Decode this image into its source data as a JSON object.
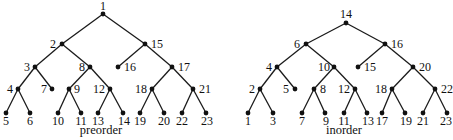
{
  "trees": [
    {
      "caption": "preorder",
      "caption_pos": [
        101,
        134
      ],
      "nodes": [
        {
          "id": "1",
          "x": 103,
          "y": 14,
          "lx": 103,
          "ly": 10,
          "anchor": "middle"
        },
        {
          "id": "2",
          "x": 62,
          "y": 44,
          "lx": 56,
          "ly": 48,
          "anchor": "end"
        },
        {
          "id": "15",
          "x": 145,
          "y": 44,
          "lx": 151,
          "ly": 48,
          "anchor": "start"
        },
        {
          "id": "3",
          "x": 35,
          "y": 67,
          "lx": 30,
          "ly": 71,
          "anchor": "end"
        },
        {
          "id": "8",
          "x": 90,
          "y": 67,
          "lx": 85,
          "ly": 71,
          "anchor": "end"
        },
        {
          "id": "16",
          "x": 118,
          "y": 67,
          "lx": 124,
          "ly": 71,
          "anchor": "start"
        },
        {
          "id": "17",
          "x": 172,
          "y": 67,
          "lx": 178,
          "ly": 71,
          "anchor": "start"
        },
        {
          "id": "4",
          "x": 18,
          "y": 89,
          "lx": 13,
          "ly": 93,
          "anchor": "end"
        },
        {
          "id": "7",
          "x": 52,
          "y": 89,
          "lx": 47,
          "ly": 93,
          "anchor": "end"
        },
        {
          "id": "9",
          "x": 69,
          "y": 89,
          "lx": 74,
          "ly": 93,
          "anchor": "start"
        },
        {
          "id": "12",
          "x": 110,
          "y": 89,
          "lx": 105,
          "ly": 93,
          "anchor": "end"
        },
        {
          "id": "18",
          "x": 152,
          "y": 89,
          "lx": 147,
          "ly": 93,
          "anchor": "end"
        },
        {
          "id": "21",
          "x": 193,
          "y": 89,
          "lx": 199,
          "ly": 93,
          "anchor": "start"
        },
        {
          "id": "5",
          "x": 6,
          "y": 113,
          "lx": 6,
          "ly": 125,
          "anchor": "middle"
        },
        {
          "id": "6",
          "x": 30,
          "y": 113,
          "lx": 30,
          "ly": 125,
          "anchor": "middle"
        },
        {
          "id": "10",
          "x": 58,
          "y": 113,
          "lx": 58,
          "ly": 125,
          "anchor": "middle"
        },
        {
          "id": "11",
          "x": 81,
          "y": 113,
          "lx": 81,
          "ly": 125,
          "anchor": "middle"
        },
        {
          "id": "13",
          "x": 98,
          "y": 113,
          "lx": 98,
          "ly": 125,
          "anchor": "middle"
        },
        {
          "id": "14",
          "x": 123,
          "y": 113,
          "lx": 124,
          "ly": 125,
          "anchor": "middle"
        },
        {
          "id": "19",
          "x": 140,
          "y": 113,
          "lx": 140,
          "ly": 125,
          "anchor": "middle"
        },
        {
          "id": "20",
          "x": 164,
          "y": 113,
          "lx": 164,
          "ly": 125,
          "anchor": "middle"
        },
        {
          "id": "22",
          "x": 182,
          "y": 113,
          "lx": 182,
          "ly": 125,
          "anchor": "middle"
        },
        {
          "id": "23",
          "x": 206,
          "y": 113,
          "lx": 207,
          "ly": 125,
          "anchor": "middle"
        }
      ],
      "edges": [
        [
          "1",
          "2"
        ],
        [
          "1",
          "15"
        ],
        [
          "2",
          "3"
        ],
        [
          "2",
          "8"
        ],
        [
          "15",
          "16"
        ],
        [
          "15",
          "17"
        ],
        [
          "3",
          "4"
        ],
        [
          "3",
          "7"
        ],
        [
          "8",
          "9"
        ],
        [
          "8",
          "12"
        ],
        [
          "17",
          "18"
        ],
        [
          "17",
          "21"
        ],
        [
          "4",
          "5"
        ],
        [
          "4",
          "6"
        ],
        [
          "9",
          "10"
        ],
        [
          "9",
          "11"
        ],
        [
          "12",
          "13"
        ],
        [
          "12",
          "14"
        ],
        [
          "18",
          "19"
        ],
        [
          "18",
          "20"
        ],
        [
          "21",
          "22"
        ],
        [
          "21",
          "23"
        ]
      ]
    },
    {
      "caption": "inorder",
      "caption_pos": [
        344,
        134
      ],
      "nodes": [
        {
          "id": "14",
          "x": 346,
          "y": 23,
          "lx": 346,
          "ly": 18,
          "anchor": "middle"
        },
        {
          "id": "6",
          "x": 306,
          "y": 44,
          "lx": 300,
          "ly": 48,
          "anchor": "end"
        },
        {
          "id": "16",
          "x": 385,
          "y": 44,
          "lx": 391,
          "ly": 48,
          "anchor": "start"
        },
        {
          "id": "4",
          "x": 277,
          "y": 67,
          "lx": 272,
          "ly": 71,
          "anchor": "end"
        },
        {
          "id": "10",
          "x": 334,
          "y": 67,
          "lx": 330,
          "ly": 71,
          "anchor": "end"
        },
        {
          "id": "15",
          "x": 358,
          "y": 67,
          "lx": 364,
          "ly": 71,
          "anchor": "start"
        },
        {
          "id": "20",
          "x": 413,
          "y": 67,
          "lx": 419,
          "ly": 71,
          "anchor": "start"
        },
        {
          "id": "2",
          "x": 260,
          "y": 89,
          "lx": 255,
          "ly": 93,
          "anchor": "end"
        },
        {
          "id": "5",
          "x": 295,
          "y": 89,
          "lx": 289,
          "ly": 93,
          "anchor": "end"
        },
        {
          "id": "8",
          "x": 314,
          "y": 89,
          "lx": 320,
          "ly": 93,
          "anchor": "start"
        },
        {
          "id": "12",
          "x": 355,
          "y": 89,
          "lx": 350,
          "ly": 93,
          "anchor": "end"
        },
        {
          "id": "18",
          "x": 392,
          "y": 89,
          "lx": 387,
          "ly": 93,
          "anchor": "end"
        },
        {
          "id": "22",
          "x": 435,
          "y": 89,
          "lx": 441,
          "ly": 93,
          "anchor": "start"
        },
        {
          "id": "1",
          "x": 248,
          "y": 113,
          "lx": 248,
          "ly": 125,
          "anchor": "middle"
        },
        {
          "id": "3",
          "x": 273,
          "y": 113,
          "lx": 273,
          "ly": 125,
          "anchor": "middle"
        },
        {
          "id": "7",
          "x": 302,
          "y": 113,
          "lx": 302,
          "ly": 125,
          "anchor": "middle"
        },
        {
          "id": "9",
          "x": 325,
          "y": 113,
          "lx": 326,
          "ly": 125,
          "anchor": "middle"
        },
        {
          "id": "11",
          "x": 344,
          "y": 113,
          "lx": 344,
          "ly": 125,
          "anchor": "middle"
        },
        {
          "id": "13",
          "x": 367,
          "y": 113,
          "lx": 368,
          "ly": 125,
          "anchor": "middle"
        },
        {
          "id": "17",
          "x": 382,
          "y": 113,
          "lx": 382,
          "ly": 125,
          "anchor": "middle"
        },
        {
          "id": "19",
          "x": 405,
          "y": 113,
          "lx": 406,
          "ly": 125,
          "anchor": "middle"
        },
        {
          "id": "21",
          "x": 423,
          "y": 113,
          "lx": 423,
          "ly": 125,
          "anchor": "middle"
        },
        {
          "id": "23",
          "x": 447,
          "y": 113,
          "lx": 446,
          "ly": 125,
          "anchor": "middle"
        }
      ],
      "edges": [
        [
          "14",
          "6"
        ],
        [
          "14",
          "16"
        ],
        [
          "6",
          "4"
        ],
        [
          "6",
          "10"
        ],
        [
          "16",
          "15"
        ],
        [
          "16",
          "20"
        ],
        [
          "4",
          "2"
        ],
        [
          "4",
          "5"
        ],
        [
          "10",
          "8"
        ],
        [
          "10",
          "12"
        ],
        [
          "20",
          "18"
        ],
        [
          "20",
          "22"
        ],
        [
          "2",
          "1"
        ],
        [
          "2",
          "3"
        ],
        [
          "8",
          "7"
        ],
        [
          "8",
          "9"
        ],
        [
          "12",
          "11"
        ],
        [
          "12",
          "13"
        ],
        [
          "18",
          "17"
        ],
        [
          "18",
          "19"
        ],
        [
          "22",
          "21"
        ],
        [
          "22",
          "23"
        ]
      ]
    }
  ]
}
